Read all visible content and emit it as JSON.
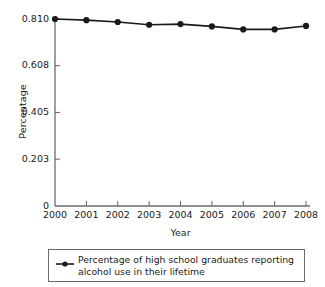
{
  "chart_data": {
    "type": "line",
    "title": "",
    "subtitle": "",
    "xlabel": "Year",
    "ylabel": "Percentage",
    "categories": [
      "2000",
      "2001",
      "2002",
      "2003",
      "2004",
      "2005",
      "2006",
      "2007",
      "2008"
    ],
    "x": [
      2000,
      2001,
      2002,
      2003,
      2004,
      2005,
      2006,
      2007,
      2008
    ],
    "series": [
      {
        "name": "Percentage of high school graduates reporting alcohol use in their lifetime",
        "values": [
          0.81,
          0.805,
          0.797,
          0.785,
          0.788,
          0.778,
          0.765,
          0.765,
          0.78
        ]
      }
    ],
    "ylim": [
      0,
      0.81
    ],
    "xlim": [
      2000,
      2008
    ],
    "yticks": [
      0,
      0.203,
      0.405,
      0.608,
      0.81
    ],
    "ytick_labels": [
      "0",
      "0.203",
      "0.405",
      "0.608",
      "0.810"
    ],
    "xtick_labels": [
      "2000",
      "2001",
      "2002",
      "2003",
      "2004",
      "2005",
      "2006",
      "2007",
      "2008"
    ],
    "grid": false,
    "legend_position": "below",
    "marker": "filled-circle",
    "line_color": "#1a1a1a",
    "marker_color": "#1a1a1a",
    "axis_color": "#6b6b6b",
    "background_color": "#ffffff"
  },
  "legend": {
    "entries": [
      {
        "label": "Percentage of high school graduates reporting alcohol use in their lifetime",
        "marker": "line-with-dot-marker"
      }
    ]
  }
}
